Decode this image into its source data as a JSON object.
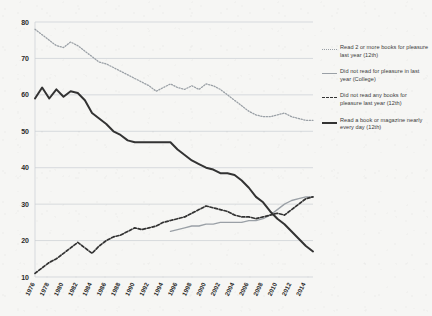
{
  "chart_data": {
    "type": "line",
    "title": "",
    "subtitle": "",
    "xlabel": "",
    "ylabel": "",
    "xlim": [
      1976,
      2015
    ],
    "ylim": [
      10,
      80
    ],
    "yticks": [
      10,
      20,
      30,
      40,
      50,
      60,
      70,
      80
    ],
    "grid": true,
    "legend_position": "right",
    "xticks": [
      1976,
      1978,
      1980,
      1982,
      1984,
      1986,
      1988,
      1990,
      1992,
      1994,
      1996,
      1998,
      2000,
      2002,
      2004,
      2006,
      2008,
      2010,
      2012,
      2014
    ],
    "x": [
      1976,
      1977,
      1978,
      1979,
      1980,
      1981,
      1982,
      1983,
      1984,
      1985,
      1986,
      1987,
      1988,
      1989,
      1990,
      1991,
      1992,
      1993,
      1994,
      1995,
      1996,
      1997,
      1998,
      1999,
      2000,
      2001,
      2002,
      2003,
      2004,
      2005,
      2006,
      2007,
      2008,
      2009,
      2010,
      2011,
      2012,
      2013,
      2014,
      2015
    ],
    "series": [
      {
        "name": "Read 2 or more books for pleasure last year (12th)",
        "style": "dotted",
        "color": "#9aa0a6",
        "values": [
          78.0,
          76.5,
          75.0,
          73.5,
          73.0,
          74.5,
          73.5,
          72.0,
          70.5,
          69.0,
          68.5,
          67.5,
          66.5,
          65.5,
          64.5,
          63.5,
          62.5,
          61.0,
          62.0,
          63.0,
          62.0,
          61.5,
          62.5,
          61.5,
          63.0,
          62.5,
          61.5,
          60.0,
          58.5,
          57.0,
          55.5,
          54.5,
          54.0,
          54.0,
          54.5,
          55.0,
          54.0,
          53.5,
          53.0,
          53.0
        ]
      },
      {
        "name": "Did not read for pleasure in last year (College)",
        "style": "solid",
        "color": "#9aa0a6",
        "values": [
          null,
          null,
          null,
          null,
          null,
          null,
          null,
          null,
          null,
          null,
          null,
          null,
          null,
          null,
          null,
          null,
          null,
          null,
          null,
          22.5,
          23.0,
          23.5,
          24.0,
          24.0,
          24.5,
          24.5,
          25.0,
          25.0,
          25.0,
          25.0,
          25.5,
          25.5,
          26.0,
          27.0,
          28.5,
          30.0,
          31.0,
          31.5,
          32.0,
          32.0
        ]
      },
      {
        "name": "Did not read any books for pleasure last year (12th)",
        "style": "dashed",
        "color": "#333333",
        "values": [
          11.0,
          12.5,
          14.0,
          15.0,
          16.5,
          18.0,
          19.5,
          18.0,
          16.5,
          18.5,
          20.0,
          21.0,
          21.5,
          22.5,
          23.5,
          23.0,
          23.5,
          24.0,
          25.0,
          25.5,
          26.0,
          26.5,
          27.5,
          28.5,
          29.5,
          29.0,
          28.5,
          28.0,
          27.0,
          26.5,
          26.5,
          26.0,
          26.5,
          27.0,
          27.5,
          27.0,
          28.5,
          30.0,
          31.5,
          32.0
        ]
      },
      {
        "name": "Read a book or magazine nearly every day (12th)",
        "style": "solid",
        "color": "#333333",
        "values": [
          59.0,
          62.0,
          59.0,
          61.5,
          59.5,
          61.0,
          60.5,
          58.5,
          55.0,
          53.5,
          52.0,
          50.0,
          49.0,
          47.5,
          47.0,
          47.0,
          47.0,
          47.0,
          47.0,
          47.0,
          45.0,
          43.5,
          42.0,
          41.0,
          40.0,
          39.5,
          38.5,
          38.5,
          38.0,
          36.5,
          34.5,
          32.0,
          30.5,
          28.0,
          26.0,
          24.5,
          22.5,
          20.5,
          18.5,
          17.0
        ]
      }
    ]
  },
  "legend": {
    "items": [
      {
        "label": "Read 2 or more books for pleasure last year (12th)",
        "style": "dotted"
      },
      {
        "label": "Did not read for pleasure in last year (College)",
        "style": "solid-gray"
      },
      {
        "label": "Did not read any books for pleasure last year (12th)",
        "style": "dashed"
      },
      {
        "label": "Read a book or magazine nearly every day (12th)",
        "style": "solid-black"
      }
    ]
  }
}
